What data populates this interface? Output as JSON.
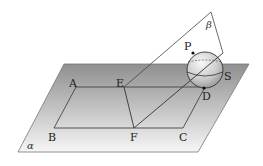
{
  "diagram": {
    "planes": {
      "alpha": "α",
      "beta": "β"
    },
    "points": {
      "A": "A",
      "B": "B",
      "C": "C",
      "D": "D",
      "E": "E",
      "F": "F",
      "P": "P",
      "S": "S"
    },
    "colors": {
      "plane_top": "#8f8f8f",
      "plane_bottom": "#f4f4f4",
      "line": "#333333"
    }
  }
}
